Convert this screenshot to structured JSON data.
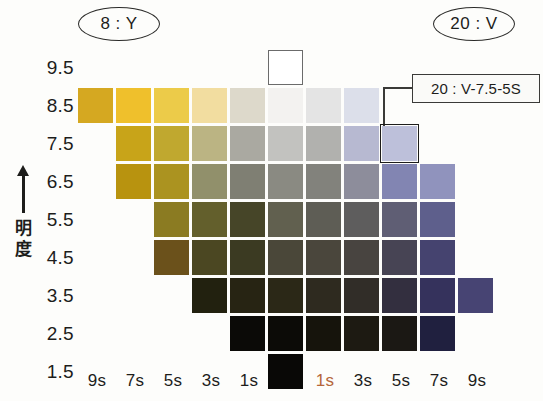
{
  "tags": {
    "left": "8 : Y",
    "right": "20 : V"
  },
  "callout": {
    "label": "20 : V-7.5-5S",
    "target_row": "7.5",
    "target_col": "5s",
    "target_side": "right"
  },
  "axes": {
    "y_title": "明度",
    "y_arrow": "up-arrow",
    "y_labels": [
      "9.5",
      "8.5",
      "7.5",
      "6.5",
      "5.5",
      "4.5",
      "3.5",
      "2.5",
      "1.5"
    ],
    "x_labels": [
      "9s",
      "7s",
      "5s",
      "3s",
      "1s",
      "0",
      "1s",
      "3s",
      "5s",
      "7s",
      "9s"
    ],
    "x_label_accent_index": 6,
    "x_label_accent_color": "#b5663a"
  },
  "chart_data": {
    "type": "heatmap",
    "title": "",
    "xlabel": "",
    "ylabel": "明度",
    "categories": [
      "9s",
      "7s",
      "5s",
      "3s",
      "1s",
      "0",
      "1s",
      "3s",
      "5s",
      "7s",
      "9s"
    ],
    "rows": [
      "9.5",
      "8.5",
      "7.5",
      "6.5",
      "5.5",
      "4.5",
      "3.5",
      "2.5",
      "1.5"
    ],
    "legend_position": "none",
    "grid": false,
    "cells": [
      {
        "row": "9.5",
        "col": 5,
        "color": "#ffffff",
        "outlined": true
      },
      {
        "row": "8.5",
        "col": 0,
        "color": "#d5a821"
      },
      {
        "row": "8.5",
        "col": 1,
        "color": "#efc02c"
      },
      {
        "row": "8.5",
        "col": 2,
        "color": "#eccb49"
      },
      {
        "row": "8.5",
        "col": 3,
        "color": "#f2dda0"
      },
      {
        "row": "8.5",
        "col": 4,
        "color": "#ddd9cb"
      },
      {
        "row": "8.5",
        "col": 5,
        "color": "#f3f2f0"
      },
      {
        "row": "8.5",
        "col": 6,
        "color": "#e4e4e4"
      },
      {
        "row": "8.5",
        "col": 7,
        "color": "#dcdfea"
      },
      {
        "row": "7.5",
        "col": 1,
        "color": "#c8a419"
      },
      {
        "row": "7.5",
        "col": 2,
        "color": "#c0a82f"
      },
      {
        "row": "7.5",
        "col": 3,
        "color": "#bbb483"
      },
      {
        "row": "7.5",
        "col": 4,
        "color": "#aaa9a1"
      },
      {
        "row": "7.5",
        "col": 5,
        "color": "#c2c2bf"
      },
      {
        "row": "7.5",
        "col": 6,
        "color": "#b1b1ae"
      },
      {
        "row": "7.5",
        "col": 7,
        "color": "#b7b9d1"
      },
      {
        "row": "7.5",
        "col": 8,
        "color": "#bdc0da",
        "selected": true
      },
      {
        "row": "6.5",
        "col": 1,
        "color": "#b8930f"
      },
      {
        "row": "6.5",
        "col": 2,
        "color": "#ab9320"
      },
      {
        "row": "6.5",
        "col": 3,
        "color": "#91906b"
      },
      {
        "row": "6.5",
        "col": 4,
        "color": "#7f7f73"
      },
      {
        "row": "6.5",
        "col": 5,
        "color": "#8a8a82"
      },
      {
        "row": "6.5",
        "col": 6,
        "color": "#82827c"
      },
      {
        "row": "6.5",
        "col": 7,
        "color": "#8d8d9b"
      },
      {
        "row": "6.5",
        "col": 8,
        "color": "#8285b2"
      },
      {
        "row": "6.5",
        "col": 9,
        "color": "#9093bd"
      },
      {
        "row": "5.5",
        "col": 2,
        "color": "#8b7b22"
      },
      {
        "row": "5.5",
        "col": 3,
        "color": "#635f2c"
      },
      {
        "row": "5.5",
        "col": 4,
        "color": "#464528"
      },
      {
        "row": "5.5",
        "col": 5,
        "color": "#61604f"
      },
      {
        "row": "5.5",
        "col": 6,
        "color": "#5e5d55"
      },
      {
        "row": "5.5",
        "col": 7,
        "color": "#5e5d5d"
      },
      {
        "row": "5.5",
        "col": 8,
        "color": "#5f5e74"
      },
      {
        "row": "5.5",
        "col": 9,
        "color": "#5e5f8c"
      },
      {
        "row": "4.5",
        "col": 2,
        "color": "#6b511b"
      },
      {
        "row": "4.5",
        "col": 3,
        "color": "#4b4722"
      },
      {
        "row": "4.5",
        "col": 4,
        "color": "#3b3a22"
      },
      {
        "row": "4.5",
        "col": 5,
        "color": "#4a4739"
      },
      {
        "row": "4.5",
        "col": 6,
        "color": "#4a463c"
      },
      {
        "row": "4.5",
        "col": 7,
        "color": "#484440"
      },
      {
        "row": "4.5",
        "col": 8,
        "color": "#474454"
      },
      {
        "row": "4.5",
        "col": 9,
        "color": "#45436f"
      },
      {
        "row": "3.5",
        "col": 3,
        "color": "#22210f"
      },
      {
        "row": "3.5",
        "col": 4,
        "color": "#272413"
      },
      {
        "row": "3.5",
        "col": 5,
        "color": "#2b2817"
      },
      {
        "row": "3.5",
        "col": 6,
        "color": "#2e2a1f"
      },
      {
        "row": "3.5",
        "col": 7,
        "color": "#312d28"
      },
      {
        "row": "3.5",
        "col": 8,
        "color": "#332f3f"
      },
      {
        "row": "3.5",
        "col": 9,
        "color": "#35325c"
      },
      {
        "row": "3.5",
        "col": 10,
        "color": "#474473"
      },
      {
        "row": "2.5",
        "col": 4,
        "color": "#0b0a07"
      },
      {
        "row": "2.5",
        "col": 5,
        "color": "#0c0b07"
      },
      {
        "row": "2.5",
        "col": 6,
        "color": "#16140c"
      },
      {
        "row": "2.5",
        "col": 7,
        "color": "#1d1a12"
      },
      {
        "row": "2.5",
        "col": 8,
        "color": "#1b1814"
      },
      {
        "row": "2.5",
        "col": 9,
        "color": "#20203f"
      },
      {
        "row": "1.5",
        "col": 5,
        "color": "#090806"
      }
    ]
  }
}
